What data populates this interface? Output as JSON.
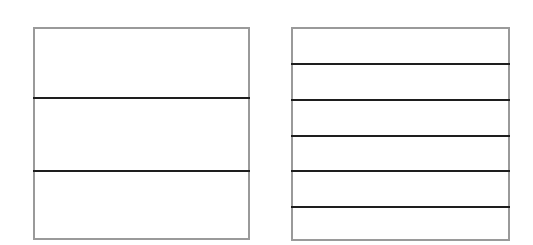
{
  "diagram": {
    "boxes": [
      {
        "name": "left-rectangle",
        "x": 33,
        "y": 27,
        "width": 217,
        "height": 213,
        "border_color": "#9a9a9a",
        "divider_lines_y": [
          98,
          171
        ],
        "divider_count": 2,
        "sections": 3
      },
      {
        "name": "right-rectangle",
        "x": 291,
        "y": 27,
        "width": 219,
        "height": 214,
        "border_color": "#9a9a9a",
        "divider_lines_y": [
          64,
          100,
          136,
          171,
          207
        ],
        "divider_count": 5,
        "sections": 6
      }
    ],
    "line_color": "#1e1e1e"
  }
}
